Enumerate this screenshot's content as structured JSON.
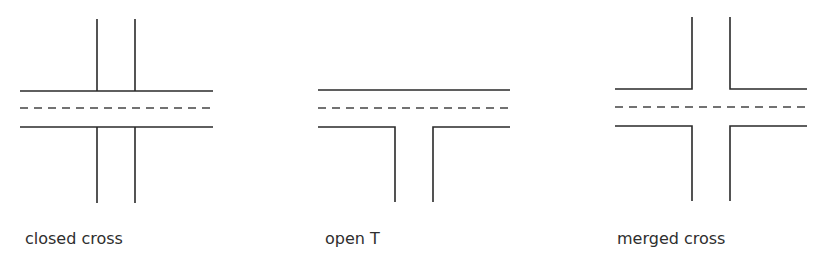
{
  "diagrams": [
    {
      "id": "closed-cross",
      "label": "closed cross",
      "label_pos": {
        "x": 25,
        "y": 231
      },
      "solid_lines": [
        [
          [
            20,
            91
          ],
          [
            213,
            91
          ]
        ],
        [
          [
            20,
            127
          ],
          [
            213,
            127
          ]
        ],
        [
          [
            97,
            19
          ],
          [
            97,
            91
          ]
        ],
        [
          [
            135,
            19
          ],
          [
            135,
            91
          ]
        ],
        [
          [
            97,
            127
          ],
          [
            97,
            203
          ]
        ],
        [
          [
            135,
            127
          ],
          [
            135,
            203
          ]
        ]
      ],
      "dashed_line": [
        [
          20,
          108
        ],
        [
          213,
          108
        ]
      ]
    },
    {
      "id": "open-t",
      "label": "open T",
      "label_pos": {
        "x": 325,
        "y": 231
      },
      "solid_lines": [
        [
          [
            318,
            90
          ],
          [
            510,
            90
          ]
        ],
        [
          [
            318,
            127
          ],
          [
            395,
            127
          ],
          [
            395,
            202
          ]
        ],
        [
          [
            433,
            202
          ],
          [
            433,
            127
          ],
          [
            510,
            127
          ]
        ]
      ],
      "dashed_line": [
        [
          318,
          108
        ],
        [
          510,
          108
        ]
      ]
    },
    {
      "id": "merged-cross",
      "label": "merged cross",
      "label_pos": {
        "x": 617,
        "y": 231
      },
      "solid_lines": [
        [
          [
            615,
            89
          ],
          [
            692,
            89
          ],
          [
            692,
            17
          ]
        ],
        [
          [
            730,
            17
          ],
          [
            730,
            89
          ],
          [
            807,
            89
          ]
        ],
        [
          [
            615,
            126
          ],
          [
            692,
            126
          ],
          [
            692,
            201
          ]
        ],
        [
          [
            730,
            201
          ],
          [
            730,
            126
          ],
          [
            807,
            126
          ]
        ]
      ],
      "dashed_line": [
        [
          615,
          107
        ],
        [
          807,
          107
        ]
      ]
    }
  ],
  "style": {
    "stroke_color": "#2a2a2a",
    "dash_color": "#444444",
    "stroke_width": 1.6,
    "dash_pattern": "8 6"
  }
}
